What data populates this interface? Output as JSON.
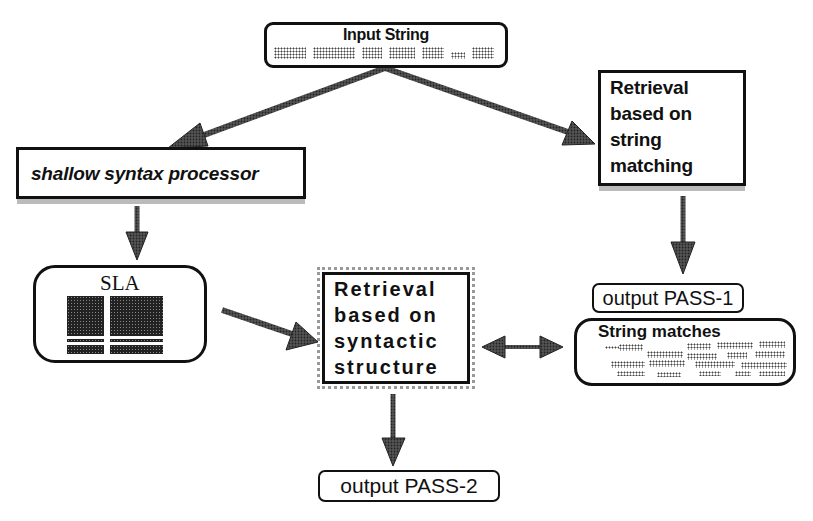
{
  "diagram": {
    "type": "flowchart",
    "nodes": {
      "input_string": {
        "label": "Input String",
        "token_count": 7
      },
      "string_retrieval": {
        "label": "Retrieval\nbased on\nstring\nmatching"
      },
      "shallow_syntax": {
        "label": "shallow syntax processor"
      },
      "sla": {
        "label": "SLA"
      },
      "syntactic_retrieval": {
        "label": "Retrieval\nbased on\nsyntactic\nstructure"
      },
      "output_pass1": {
        "label": "output PASS-1"
      },
      "string_matches": {
        "label": "String matches"
      },
      "output_pass2": {
        "label": "output PASS-2"
      }
    },
    "edges": [
      {
        "from": "Input String",
        "to": "shallow syntax processor",
        "direction": "forward"
      },
      {
        "from": "Input String",
        "to": "Retrieval based on string matching",
        "direction": "forward"
      },
      {
        "from": "shallow syntax processor",
        "to": "SLA",
        "direction": "forward"
      },
      {
        "from": "Retrieval based on string matching",
        "to": "output PASS-1",
        "direction": "forward"
      },
      {
        "from": "SLA",
        "to": "Retrieval based on syntactic structure",
        "direction": "forward"
      },
      {
        "from": "Retrieval based on syntactic structure",
        "to": "String matches",
        "direction": "bidirectional"
      },
      {
        "from": "Retrieval based on syntactic structure",
        "to": "output PASS-2",
        "direction": "forward"
      }
    ],
    "colors": {
      "stroke": "#111111",
      "shade": "#bbbbbb",
      "arrow_fill": "#333333"
    }
  }
}
